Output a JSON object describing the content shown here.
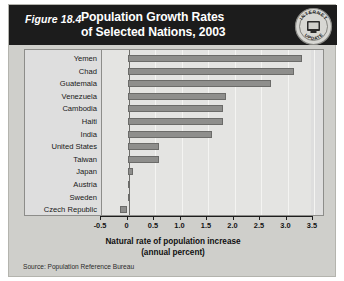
{
  "figure": {
    "number_label": "Figure 18.4",
    "title_lines": [
      "Population Growth Rates",
      "of Selected Nations, 2003"
    ],
    "badge": {
      "name": "internet-update-badge",
      "top_text": "INTERNET",
      "bottom_text": "UPDATE",
      "icon": "computer-monitor-icon"
    },
    "source": "Source:  Population Reference Bureau"
  },
  "chart_data": {
    "type": "bar",
    "orientation": "horizontal",
    "title": "Population Growth Rates of Selected Nations, 2003",
    "categories": [
      "Yemen",
      "Chad",
      "Guatemala",
      "Venezuela",
      "Cambodia",
      "Haiti",
      "India",
      "United States",
      "Taiwan",
      "Japan",
      "Austria",
      "Sweden",
      "Czech Republic"
    ],
    "values": [
      3.3,
      3.15,
      2.7,
      1.85,
      1.8,
      1.8,
      1.6,
      0.6,
      0.6,
      0.1,
      0.0,
      0.0,
      -0.15
    ],
    "xlabel": "Natural rate of population increase (annual percent)",
    "ylabel": "",
    "xlim": [
      -0.5,
      3.5
    ],
    "xticks": [
      "-0.5",
      "0",
      "0.5",
      "1.0",
      "1.5",
      "2.0",
      "2.5",
      "3.0",
      "3.5"
    ],
    "xtick_values": [
      -0.5,
      0,
      0.5,
      1.0,
      1.5,
      2.0,
      2.5,
      3.0,
      3.5
    ],
    "grid": true,
    "legend": false,
    "bar_color": "#8e8e8c",
    "plot_background": "#e4e4e2"
  }
}
